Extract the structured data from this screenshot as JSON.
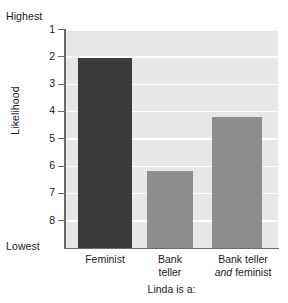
{
  "chart_data": {
    "type": "bar",
    "title": "",
    "subtitle": "",
    "xlabel": "Linda is a:",
    "ylabel": "Likelihood",
    "categories": [
      "Feminist",
      "Bank teller",
      "Bank teller and feminist"
    ],
    "category_lines": [
      [
        "Feminist"
      ],
      [
        "Bank",
        "teller"
      ],
      [
        "Bank teller",
        "and feminist"
      ]
    ],
    "values": [
      2.05,
      6.2,
      4.2
    ],
    "series": [
      {
        "name": "Likelihood rank",
        "values": [
          2.05,
          6.2,
          4.2
        ]
      }
    ],
    "ylim": [
      1,
      8
    ],
    "y_inverted": true,
    "y_ticks": [
      "1",
      "2",
      "3",
      "4",
      "5",
      "6",
      "7",
      "8"
    ],
    "y_axis_top_annotation": "Highest",
    "y_axis_bottom_annotation": "Lowest",
    "grid": true,
    "grid_orientation": "horizontal",
    "legend": "none",
    "bar_colors": [
      "#3b3b3b",
      "#8d8d8d",
      "#8d8d8d"
    ],
    "plot_background": "#e7e7e7",
    "gridline_color": "#fdfdfd",
    "axis_color": "#6a6a6a",
    "annotations": []
  },
  "axis": {
    "highest_label": "Highest",
    "lowest_label": "Lowest",
    "y_title": "Likelihood",
    "x_title": "Linda is a:"
  },
  "ticks": {
    "t1": "1",
    "t2": "2",
    "t3": "3",
    "t4": "4",
    "t5": "5",
    "t6": "6",
    "t7": "7",
    "t8": "8"
  },
  "categories": {
    "c1_line1": "Feminist",
    "c2_line1": "Bank",
    "c2_line2": "teller",
    "c3_line1": "Bank teller",
    "c3_italic": "and",
    "c3_rest": " feminist"
  }
}
